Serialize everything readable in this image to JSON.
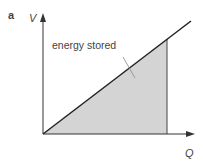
{
  "figure": {
    "panel_label": "a",
    "y_axis_label": "V",
    "x_axis_label": "Q",
    "annotation": "energy stored",
    "colors": {
      "shade": "#d4d4d4",
      "line": "#222222",
      "axis": "#333333"
    }
  }
}
